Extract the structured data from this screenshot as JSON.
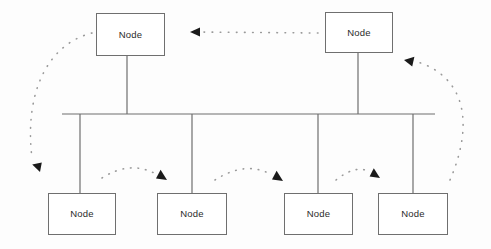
{
  "diagram": {
    "type": "network-topology",
    "background_color": "#fdfdfd",
    "line_color": "#6f6f6f",
    "dot_color": "#9a9a9a",
    "arrow_color": "#1a1a1a",
    "text_color": "#2b2b2b",
    "node_fill": "#ffffff",
    "nodes": [
      {
        "id": "node-top-left",
        "label": "Node",
        "x": 96,
        "y": 13,
        "w": 69,
        "h": 43,
        "row": "top"
      },
      {
        "id": "node-top-right",
        "label": "Node",
        "x": 325,
        "y": 12,
        "w": 68,
        "h": 41,
        "row": "top"
      },
      {
        "id": "node-bottom-1",
        "label": "Node",
        "x": 48,
        "y": 193,
        "w": 68,
        "h": 42,
        "row": "bottom"
      },
      {
        "id": "node-bottom-2",
        "label": "Node",
        "x": 157,
        "y": 193,
        "w": 70,
        "h": 42,
        "row": "bottom"
      },
      {
        "id": "node-bottom-3",
        "label": "Node",
        "x": 284,
        "y": 193,
        "w": 69,
        "h": 42,
        "row": "bottom"
      },
      {
        "id": "node-bottom-4",
        "label": "Node",
        "x": 378,
        "y": 193,
        "w": 70,
        "h": 42,
        "row": "bottom"
      }
    ],
    "bus": {
      "x1": 62,
      "x2": 435,
      "y": 114
    },
    "drop_lines": [
      {
        "id": "drop-top-left",
        "x": 127,
        "y1": 56,
        "y2": 114
      },
      {
        "id": "drop-top-right",
        "x": 358,
        "y1": 53,
        "y2": 114
      },
      {
        "id": "drop-bottom-1",
        "x": 80,
        "y1": 114,
        "y2": 193
      },
      {
        "id": "drop-bottom-2",
        "x": 192,
        "y1": 114,
        "y2": 193
      },
      {
        "id": "drop-bottom-3",
        "x": 318,
        "y1": 114,
        "y2": 193
      },
      {
        "id": "drop-bottom-4",
        "x": 413,
        "y1": 114,
        "y2": 193
      }
    ],
    "signal_paths": [
      {
        "id": "signal-top-horizontal",
        "direction": "left",
        "from": "node-top-right",
        "to": "node-top-left"
      },
      {
        "id": "signal-left-arc",
        "direction": "down",
        "from": "node-top-left",
        "to": "node-bottom-1"
      },
      {
        "id": "signal-right-arc",
        "direction": "up",
        "from": "node-bottom-4",
        "to": "node-top-right"
      },
      {
        "id": "signal-bottom-arc-1",
        "direction": "right",
        "from": "node-bottom-1",
        "to": "node-bottom-2"
      },
      {
        "id": "signal-bottom-arc-2",
        "direction": "right",
        "from": "node-bottom-2",
        "to": "node-bottom-3"
      },
      {
        "id": "signal-bottom-arc-3",
        "direction": "right",
        "from": "node-bottom-3",
        "to": "node-bottom-4"
      }
    ]
  }
}
